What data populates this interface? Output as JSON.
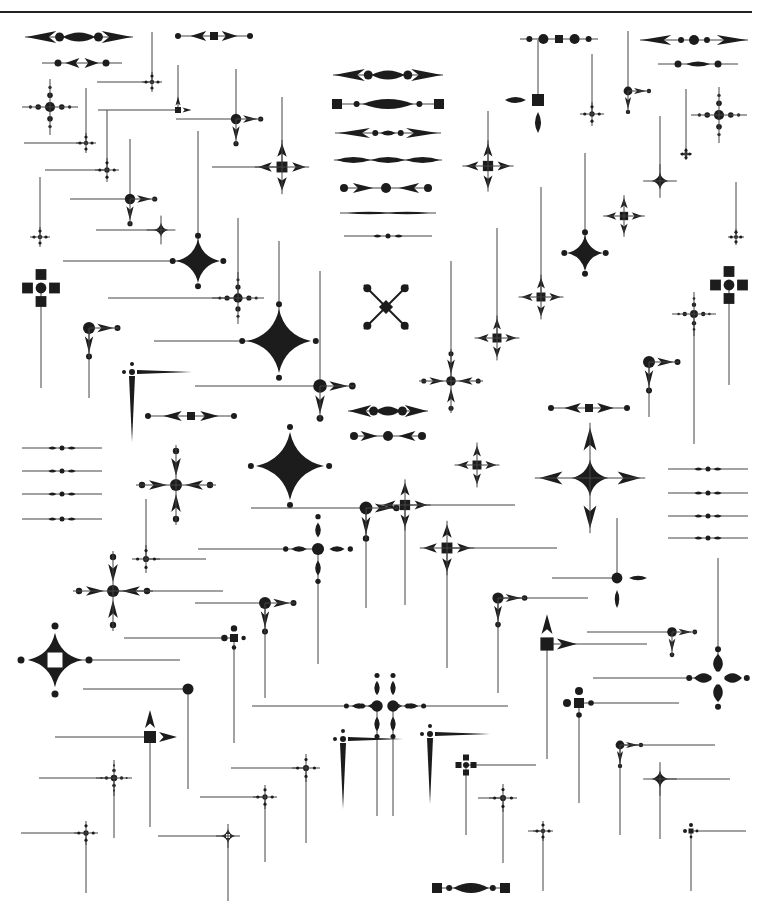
{
  "page": {
    "header": {
      "running_head": "",
      "page_number": "",
      "rule_color": "#222222"
    },
    "ink_color": "#1c1c1c",
    "line_color": "#444444",
    "background": "#ffffff"
  },
  "ornaments": {
    "horizontal_rules": [
      {
        "x": 25,
        "y": 37,
        "w": 108,
        "style": "arrow-oval"
      },
      {
        "x": 42,
        "y": 63,
        "w": 80,
        "style": "drop-pair"
      },
      {
        "x": 175,
        "y": 36,
        "w": 78,
        "style": "dot-square"
      },
      {
        "x": 520,
        "y": 39,
        "w": 78,
        "style": "dot-circle-square"
      },
      {
        "x": 640,
        "y": 40,
        "w": 108,
        "style": "arrow-circle"
      },
      {
        "x": 658,
        "y": 64,
        "w": 80,
        "style": "diamond-dots"
      },
      {
        "x": 333,
        "y": 75,
        "w": 110,
        "style": "arrow-oval"
      },
      {
        "x": 332,
        "y": 104,
        "w": 112,
        "style": "bar-oval"
      },
      {
        "x": 335,
        "y": 133,
        "w": 106,
        "style": "arrow-oval-small"
      },
      {
        "x": 334,
        "y": 160,
        "w": 108,
        "style": "triple-diamond"
      },
      {
        "x": 340,
        "y": 188,
        "w": 92,
        "style": "dot-arrow"
      },
      {
        "x": 340,
        "y": 213,
        "w": 96,
        "style": "thin-taper"
      },
      {
        "x": 344,
        "y": 236,
        "w": 88,
        "style": "thin-bead"
      },
      {
        "x": 348,
        "y": 411,
        "w": 80,
        "style": "arrow-oval"
      },
      {
        "x": 350,
        "y": 436,
        "w": 76,
        "style": "dot-arrow"
      },
      {
        "x": 145,
        "y": 416,
        "w": 92,
        "style": "dot-square"
      },
      {
        "x": 548,
        "y": 408,
        "w": 82,
        "style": "dot-square"
      },
      {
        "x": 22,
        "y": 448,
        "w": 80,
        "style": "thin-bead"
      },
      {
        "x": 22,
        "y": 471,
        "w": 80,
        "style": "thin-bead"
      },
      {
        "x": 22,
        "y": 494,
        "w": 80,
        "style": "thin-bead"
      },
      {
        "x": 22,
        "y": 519,
        "w": 80,
        "style": "thin-bead"
      },
      {
        "x": 668,
        "y": 469,
        "w": 80,
        "style": "thin-bead"
      },
      {
        "x": 668,
        "y": 493,
        "w": 80,
        "style": "thin-bead"
      },
      {
        "x": 668,
        "y": 516,
        "w": 80,
        "style": "thin-bead"
      },
      {
        "x": 668,
        "y": 538,
        "w": 80,
        "style": "thin-bead"
      },
      {
        "x": 432,
        "y": 888,
        "w": 78,
        "style": "bar-oval"
      }
    ],
    "corners": [
      {
        "cx": 50,
        "cy": 107,
        "type": "cross-dots",
        "size": 28
      },
      {
        "cx": 152,
        "cy": 82,
        "type": "small-cross",
        "size": 10,
        "hl": -55,
        "vt": -50
      },
      {
        "cx": 178,
        "cy": 110,
        "type": "square-arrow",
        "size": 10,
        "hl": -80,
        "vt": -45
      },
      {
        "cx": 236,
        "cy": 119,
        "type": "circle-arrow",
        "size": 26,
        "hl": -60,
        "vt": -50
      },
      {
        "cx": 282,
        "cy": 167,
        "type": "square-cross",
        "size": 34,
        "hl": -70,
        "vt": -70
      },
      {
        "cx": 86,
        "cy": 143,
        "type": "small-cross",
        "size": 10,
        "hl": -62,
        "vt": -55
      },
      {
        "cx": 107,
        "cy": 170,
        "type": "small-cross",
        "size": 12,
        "hl": -62,
        "vt": -60
      },
      {
        "cx": 130,
        "cy": 199,
        "type": "circle-arrow",
        "size": 26,
        "hl": -60,
        "vt": -60
      },
      {
        "cx": 40,
        "cy": 237,
        "type": "small-cross",
        "size": 10,
        "hl": 0,
        "vt": -60
      },
      {
        "cx": 161,
        "cy": 230,
        "type": "star4-small",
        "size": 12,
        "hl": -65,
        "vt": 0
      },
      {
        "cx": 198,
        "cy": 261,
        "type": "star4",
        "size": 22,
        "hl": -135,
        "vt": -130
      },
      {
        "cx": 41,
        "cy": 288,
        "type": "four-squares",
        "size": 18,
        "hl": 0,
        "vt": 100
      },
      {
        "cx": 238,
        "cy": 298,
        "type": "cross-dots",
        "size": 26,
        "hl": -130,
        "vt": -80
      },
      {
        "cx": 89,
        "cy": 328,
        "type": "circle-arrow",
        "size": 30,
        "hl": 0,
        "vt": 70
      },
      {
        "cx": 279,
        "cy": 341,
        "type": "star4",
        "size": 32,
        "hl": -125,
        "vt": -100
      },
      {
        "cx": 132,
        "cy": 372,
        "type": "sword",
        "size": 20,
        "hl": 0,
        "vt": 0
      },
      {
        "cx": 320,
        "cy": 386,
        "type": "circle-arrow",
        "size": 34,
        "hl": -125,
        "vt": -115
      },
      {
        "cx": 386,
        "cy": 307,
        "type": "saltire",
        "size": 22,
        "hl": 0,
        "vt": 0
      },
      {
        "cx": 451,
        "cy": 381,
        "type": "circle-cross",
        "size": 32,
        "hl": 0,
        "vt": -120
      },
      {
        "cx": 497,
        "cy": 338,
        "type": "square-cross",
        "size": 28,
        "hl": 0,
        "vt": -110
      },
      {
        "cx": 541,
        "cy": 297,
        "type": "square-cross",
        "size": 28,
        "hl": 0,
        "vt": -110
      },
      {
        "cx": 488,
        "cy": 166,
        "type": "square-cross",
        "size": 32,
        "hl": 0,
        "vt": -55
      },
      {
        "cx": 538,
        "cy": 100,
        "type": "square-diamond",
        "size": 30,
        "hl": 0,
        "vt": -60
      },
      {
        "cx": 628,
        "cy": 91,
        "type": "circle-arrow",
        "size": 22,
        "hl": 0,
        "vt": -60
      },
      {
        "cx": 592,
        "cy": 114,
        "type": "small-cross",
        "size": 12,
        "hl": 0,
        "vt": -60
      },
      {
        "cx": 719,
        "cy": 115,
        "type": "cross-dots",
        "size": 28,
        "hl": 0,
        "vt": 0
      },
      {
        "cx": 686,
        "cy": 154,
        "type": "small-cross",
        "size": 6,
        "hl": 0,
        "vt": -65
      },
      {
        "cx": 660,
        "cy": 181,
        "type": "star4-small",
        "size": 14,
        "hl": 0,
        "vt": -65
      },
      {
        "cx": 624,
        "cy": 216,
        "type": "square-cross",
        "size": 26,
        "hl": 0,
        "vt": 0
      },
      {
        "cx": 585,
        "cy": 253,
        "type": "star4",
        "size": 18,
        "hl": 0,
        "vt": -100
      },
      {
        "cx": 736,
        "cy": 237,
        "type": "small-cross",
        "size": 8,
        "hl": 0,
        "vt": -55
      },
      {
        "cx": 729,
        "cy": 285,
        "type": "four-squares",
        "size": 18,
        "hl": 0,
        "vt": 100
      },
      {
        "cx": 694,
        "cy": 314,
        "type": "cross-dots",
        "size": 22,
        "hl": 0,
        "vt": 130
      },
      {
        "cx": 649,
        "cy": 362,
        "type": "circle-arrow",
        "size": 30,
        "hl": 0,
        "vt": 55
      },
      {
        "cx": 176,
        "cy": 485,
        "type": "circle-cross",
        "size": 40,
        "hl": 0,
        "vt": 0
      },
      {
        "cx": 290,
        "cy": 466,
        "type": "star4",
        "size": 34,
        "hl": 0,
        "vt": 0
      },
      {
        "cx": 366,
        "cy": 508,
        "type": "circle-arrow",
        "size": 32,
        "hl": -115,
        "vt": 100
      },
      {
        "cx": 405,
        "cy": 505,
        "type": "square-cross",
        "size": 32,
        "hl": 110,
        "vt": 100
      },
      {
        "cx": 477,
        "cy": 465,
        "type": "square-cross",
        "size": 28,
        "hl": 0,
        "vt": 0
      },
      {
        "cx": 590,
        "cy": 478,
        "type": "star4-big",
        "size": 46,
        "hl": 0,
        "vt": 0
      },
      {
        "cx": 318,
        "cy": 549,
        "type": "ornate-cross",
        "size": 38,
        "hl": -120,
        "vt": 115
      },
      {
        "cx": 447,
        "cy": 548,
        "type": "square-cross",
        "size": 34,
        "hl": 110,
        "vt": 120
      },
      {
        "cx": 146,
        "cy": 559,
        "type": "small-cross",
        "size": 14,
        "hl": 60,
        "vt": -60
      },
      {
        "cx": 113,
        "cy": 591,
        "type": "circle-cross",
        "size": 40,
        "hl": 110,
        "vt": 0
      },
      {
        "cx": 265,
        "cy": 603,
        "type": "circle-arrow",
        "size": 30,
        "hl": -70,
        "vt": 95
      },
      {
        "cx": 498,
        "cy": 598,
        "type": "circle-arrow",
        "size": 28,
        "hl": 90,
        "vt": 95
      },
      {
        "cx": 617,
        "cy": 578,
        "type": "circle-diamond",
        "size": 30,
        "hl": -65,
        "vt": -60
      },
      {
        "cx": 55,
        "cy": 660,
        "type": "hollow-star",
        "size": 34,
        "hl": 125,
        "vt": 0
      },
      {
        "cx": 234,
        "cy": 638,
        "type": "square-dots",
        "size": 16,
        "hl": -110,
        "vt": 105
      },
      {
        "cx": 547,
        "cy": 644,
        "type": "square-arrow",
        "size": 22,
        "hl": 100,
        "vt": 115
      },
      {
        "cx": 672,
        "cy": 632,
        "type": "circle-arrow",
        "size": 24,
        "hl": -85,
        "vt": 0
      },
      {
        "cx": 718,
        "cy": 678,
        "type": "hollow-cross",
        "size": 32,
        "hl": -125,
        "vt": -120
      },
      {
        "cx": 188,
        "cy": 689,
        "type": "dot-only",
        "size": 10,
        "hl": -105,
        "vt": 100
      },
      {
        "cx": 579,
        "cy": 703,
        "type": "square-dots",
        "size": 20,
        "hl": 100,
        "vt": 100
      },
      {
        "cx": 150,
        "cy": 737,
        "type": "square-arrow",
        "size": 20,
        "hl": -95,
        "vt": 90
      },
      {
        "cx": 377,
        "cy": 706,
        "type": "ornate-cross",
        "size": 36,
        "hl": -125,
        "vt": 110
      },
      {
        "cx": 393,
        "cy": 706,
        "type": "ornate-cross",
        "size": 36,
        "hl": 115,
        "vt": 110
      },
      {
        "cx": 343,
        "cy": 739,
        "type": "sword",
        "size": 20,
        "hl": 0,
        "vt": 0
      },
      {
        "cx": 430,
        "cy": 734,
        "type": "sword",
        "size": 20,
        "hl": 0,
        "vt": 0
      },
      {
        "cx": 620,
        "cy": 745,
        "type": "circle-arrow",
        "size": 22,
        "hl": 95,
        "vt": 90
      },
      {
        "cx": 114,
        "cy": 778,
        "type": "cross-dots",
        "size": 18,
        "hl": -75,
        "vt": 60
      },
      {
        "cx": 306,
        "cy": 768,
        "type": "small-cross",
        "size": 14,
        "hl": -75,
        "vt": 75
      },
      {
        "cx": 466,
        "cy": 765,
        "type": "four-squares",
        "size": 10,
        "hl": 70,
        "vt": 70
      },
      {
        "cx": 503,
        "cy": 798,
        "type": "small-cross",
        "size": 14,
        "hl": -25,
        "vt": 65
      },
      {
        "cx": 660,
        "cy": 779,
        "type": "star4-small",
        "size": 14,
        "hl": 70,
        "vt": 60
      },
      {
        "cx": 265,
        "cy": 797,
        "type": "small-cross",
        "size": 12,
        "hl": -65,
        "vt": 65
      },
      {
        "cx": 543,
        "cy": 831,
        "type": "small-cross",
        "size": 10,
        "hl": -15,
        "vt": 60
      },
      {
        "cx": 86,
        "cy": 833,
        "type": "small-cross",
        "size": 12,
        "hl": -65,
        "vt": 60
      },
      {
        "cx": 228,
        "cy": 836,
        "type": "hollow-small",
        "size": 12,
        "hl": -70,
        "vt": 65
      },
      {
        "cx": 691,
        "cy": 831,
        "type": "square-dots",
        "size": 10,
        "hl": 55,
        "vt": 60
      }
    ]
  }
}
